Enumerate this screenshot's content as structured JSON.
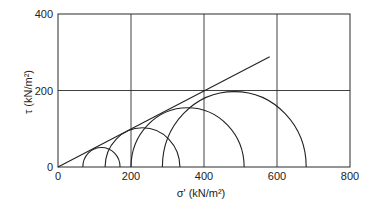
{
  "chart_data": {
    "type": "line",
    "title": "",
    "xlabel": "σ' (kN/m²)",
    "ylabel": "τ (kN/m²)",
    "xlim": [
      0,
      800
    ],
    "ylim": [
      0,
      400
    ],
    "grid": true,
    "x_ticks": [
      "0",
      "200",
      "400",
      "600",
      "800"
    ],
    "y_ticks": [
      "0",
      "200",
      "400"
    ],
    "mohr_circles": [
      {
        "name": "Circle 1",
        "sigma3": 68,
        "sigma1": 170,
        "center": 119,
        "radius": 51
      },
      {
        "name": "Circle 2",
        "sigma3": 129,
        "sigma1": 334,
        "center": 231,
        "radius": 102
      },
      {
        "name": "Circle 3",
        "sigma3": 200,
        "sigma1": 510,
        "center": 355,
        "radius": 155
      },
      {
        "name": "Circle 4",
        "sigma3": 286,
        "sigma1": 680,
        "center": 483,
        "radius": 197
      }
    ],
    "series": [
      {
        "name": "Failure envelope",
        "x": [
          0,
          580
        ],
        "y": [
          0,
          288
        ]
      }
    ],
    "legend": []
  },
  "axes": {
    "x_tick_labels": [
      "0",
      "200",
      "400",
      "600",
      "800"
    ],
    "y_tick_labels": [
      "0",
      "200",
      "400"
    ],
    "x_label": "σ' (kN/m²)",
    "y_label": "τ (kN/m²)"
  }
}
